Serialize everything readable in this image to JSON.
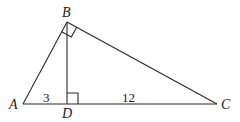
{
  "figure": {
    "type": "right-triangle-with-altitude",
    "vertices": {
      "A": {
        "label": "A",
        "x": 23,
        "y": 104
      },
      "B": {
        "label": "B",
        "x": 67,
        "y": 22
      },
      "C": {
        "label": "C",
        "x": 217,
        "y": 104
      },
      "D": {
        "label": "D",
        "x": 67,
        "y": 104
      }
    },
    "segments": [
      {
        "from": "A",
        "to": "B"
      },
      {
        "from": "B",
        "to": "C"
      },
      {
        "from": "A",
        "to": "C"
      },
      {
        "from": "B",
        "to": "D"
      }
    ],
    "right_angles": [
      "B",
      "D"
    ],
    "lengths": {
      "AD": "3",
      "DC": "12"
    }
  }
}
